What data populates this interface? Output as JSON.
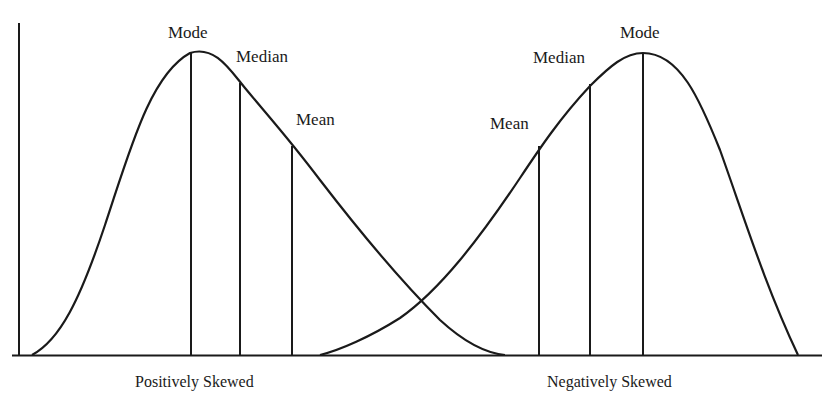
{
  "diagram": {
    "type": "skewed-distributions",
    "left": {
      "caption": "Positively Skewed",
      "labels": {
        "mode": "Mode",
        "median": "Median",
        "mean": "Mean"
      },
      "order_left_to_right": [
        "Mode",
        "Median",
        "Mean"
      ]
    },
    "right": {
      "caption": "Negatively Skewed",
      "labels": {
        "mean": "Mean",
        "median": "Median",
        "mode": "Mode"
      },
      "order_left_to_right": [
        "Mean",
        "Median",
        "Mode"
      ]
    },
    "colors": {
      "line": "#1a1a1a",
      "background": "#ffffff"
    }
  }
}
